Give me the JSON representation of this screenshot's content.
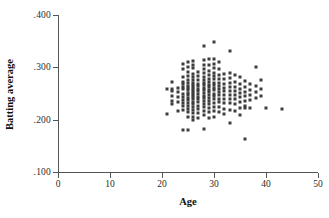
{
  "chart_data": {
    "type": "scatter",
    "title": "",
    "xlabel": "Age",
    "ylabel": "Batting average",
    "xlim": [
      0,
      50
    ],
    "ylim": [
      0.1,
      0.4
    ],
    "xticks": [
      0,
      10,
      20,
      30,
      40,
      50
    ],
    "xtick_labels": [
      "0",
      "10",
      "20",
      "30",
      "40",
      "50"
    ],
    "yticks": [
      0.1,
      0.2,
      0.3,
      0.4
    ],
    "ytick_labels": [
      ".100",
      ".200",
      ".300",
      ".400"
    ],
    "grid": false,
    "legend": null,
    "marker": "square",
    "marker_color": "#3d3d3d",
    "n_points": 206,
    "points": [
      [
        21,
        0.259
      ],
      [
        21,
        0.21
      ],
      [
        22,
        0.272
      ],
      [
        22,
        0.259
      ],
      [
        22,
        0.254
      ],
      [
        22,
        0.246
      ],
      [
        22,
        0.236
      ],
      [
        22,
        0.229
      ],
      [
        23,
        0.261
      ],
      [
        23,
        0.253
      ],
      [
        23,
        0.244
      ],
      [
        23,
        0.234
      ],
      [
        23,
        0.216
      ],
      [
        24,
        0.306
      ],
      [
        24,
        0.296
      ],
      [
        24,
        0.281
      ],
      [
        24,
        0.272
      ],
      [
        24,
        0.268
      ],
      [
        24,
        0.263
      ],
      [
        24,
        0.258
      ],
      [
        24,
        0.25
      ],
      [
        24,
        0.243
      ],
      [
        24,
        0.238
      ],
      [
        24,
        0.232
      ],
      [
        24,
        0.226
      ],
      [
        24,
        0.219
      ],
      [
        24,
        0.18
      ],
      [
        25,
        0.311
      ],
      [
        25,
        0.3
      ],
      [
        25,
        0.291
      ],
      [
        25,
        0.284
      ],
      [
        25,
        0.276
      ],
      [
        25,
        0.27
      ],
      [
        25,
        0.265
      ],
      [
        25,
        0.26
      ],
      [
        25,
        0.256
      ],
      [
        25,
        0.251
      ],
      [
        25,
        0.247
      ],
      [
        25,
        0.242
      ],
      [
        25,
        0.237
      ],
      [
        25,
        0.231
      ],
      [
        25,
        0.226
      ],
      [
        25,
        0.221
      ],
      [
        25,
        0.214
      ],
      [
        25,
        0.205
      ],
      [
        25,
        0.18
      ],
      [
        26,
        0.312
      ],
      [
        26,
        0.305
      ],
      [
        26,
        0.298
      ],
      [
        26,
        0.288
      ],
      [
        26,
        0.281
      ],
      [
        26,
        0.275
      ],
      [
        26,
        0.271
      ],
      [
        26,
        0.267
      ],
      [
        26,
        0.263
      ],
      [
        26,
        0.259
      ],
      [
        26,
        0.255
      ],
      [
        26,
        0.251
      ],
      [
        26,
        0.247
      ],
      [
        26,
        0.243
      ],
      [
        26,
        0.239
      ],
      [
        26,
        0.234
      ],
      [
        26,
        0.229
      ],
      [
        26,
        0.224
      ],
      [
        26,
        0.218
      ],
      [
        26,
        0.212
      ],
      [
        26,
        0.206
      ],
      [
        26,
        0.199
      ],
      [
        27,
        0.291
      ],
      [
        27,
        0.283
      ],
      [
        27,
        0.276
      ],
      [
        27,
        0.269
      ],
      [
        27,
        0.264
      ],
      [
        27,
        0.259
      ],
      [
        27,
        0.254
      ],
      [
        27,
        0.249
      ],
      [
        27,
        0.244
      ],
      [
        27,
        0.239
      ],
      [
        27,
        0.233
      ],
      [
        27,
        0.227
      ],
      [
        27,
        0.221
      ],
      [
        27,
        0.213
      ],
      [
        27,
        0.204
      ],
      [
        28,
        0.34
      ],
      [
        28,
        0.314
      ],
      [
        28,
        0.305
      ],
      [
        28,
        0.297
      ],
      [
        28,
        0.289
      ],
      [
        28,
        0.282
      ],
      [
        28,
        0.276
      ],
      [
        28,
        0.271
      ],
      [
        28,
        0.266
      ],
      [
        28,
        0.261
      ],
      [
        28,
        0.256
      ],
      [
        28,
        0.251
      ],
      [
        28,
        0.246
      ],
      [
        28,
        0.241
      ],
      [
        28,
        0.236
      ],
      [
        28,
        0.23
      ],
      [
        28,
        0.224
      ],
      [
        28,
        0.217
      ],
      [
        28,
        0.208
      ],
      [
        28,
        0.182
      ],
      [
        29,
        0.316
      ],
      [
        29,
        0.304
      ],
      [
        29,
        0.293
      ],
      [
        29,
        0.285
      ],
      [
        29,
        0.278
      ],
      [
        29,
        0.272
      ],
      [
        29,
        0.267
      ],
      [
        29,
        0.262
      ],
      [
        29,
        0.257
      ],
      [
        29,
        0.252
      ],
      [
        29,
        0.247
      ],
      [
        29,
        0.242
      ],
      [
        29,
        0.236
      ],
      [
        29,
        0.229
      ],
      [
        29,
        0.222
      ],
      [
        29,
        0.214
      ],
      [
        29,
        0.203
      ],
      [
        30,
        0.348
      ],
      [
        30,
        0.315
      ],
      [
        30,
        0.306
      ],
      [
        30,
        0.298
      ],
      [
        30,
        0.29
      ],
      [
        30,
        0.283
      ],
      [
        30,
        0.277
      ],
      [
        30,
        0.271
      ],
      [
        30,
        0.266
      ],
      [
        30,
        0.261
      ],
      [
        30,
        0.256
      ],
      [
        30,
        0.25
      ],
      [
        30,
        0.245
      ],
      [
        30,
        0.239
      ],
      [
        30,
        0.232
      ],
      [
        30,
        0.225
      ],
      [
        30,
        0.216
      ],
      [
        30,
        0.206
      ],
      [
        31,
        0.31
      ],
      [
        31,
        0.296
      ],
      [
        31,
        0.286
      ],
      [
        31,
        0.278
      ],
      [
        31,
        0.271
      ],
      [
        31,
        0.265
      ],
      [
        31,
        0.259
      ],
      [
        31,
        0.253
      ],
      [
        31,
        0.247
      ],
      [
        31,
        0.24
      ],
      [
        31,
        0.233
      ],
      [
        31,
        0.224
      ],
      [
        31,
        0.214
      ],
      [
        32,
        0.288
      ],
      [
        32,
        0.277
      ],
      [
        32,
        0.268
      ],
      [
        32,
        0.261
      ],
      [
        32,
        0.254
      ],
      [
        32,
        0.247
      ],
      [
        32,
        0.24
      ],
      [
        32,
        0.231
      ],
      [
        32,
        0.221
      ],
      [
        32,
        0.211
      ],
      [
        33,
        0.331
      ],
      [
        33,
        0.29
      ],
      [
        33,
        0.279
      ],
      [
        33,
        0.27
      ],
      [
        33,
        0.262
      ],
      [
        33,
        0.255
      ],
      [
        33,
        0.248
      ],
      [
        33,
        0.24
      ],
      [
        33,
        0.231
      ],
      [
        33,
        0.219
      ],
      [
        33,
        0.193
      ],
      [
        34,
        0.286
      ],
      [
        34,
        0.272
      ],
      [
        34,
        0.263
      ],
      [
        34,
        0.255
      ],
      [
        34,
        0.247
      ],
      [
        34,
        0.239
      ],
      [
        34,
        0.229
      ],
      [
        34,
        0.217
      ],
      [
        35,
        0.281
      ],
      [
        35,
        0.268
      ],
      [
        35,
        0.259
      ],
      [
        35,
        0.251
      ],
      [
        35,
        0.243
      ],
      [
        35,
        0.234
      ],
      [
        35,
        0.223
      ],
      [
        35,
        0.209
      ],
      [
        36,
        0.273
      ],
      [
        36,
        0.262
      ],
      [
        36,
        0.253
      ],
      [
        36,
        0.245
      ],
      [
        36,
        0.236
      ],
      [
        36,
        0.226
      ],
      [
        36,
        0.222
      ],
      [
        36,
        0.163
      ],
      [
        37,
        0.269
      ],
      [
        37,
        0.257
      ],
      [
        37,
        0.248
      ],
      [
        37,
        0.238
      ],
      [
        37,
        0.223
      ],
      [
        38,
        0.301
      ],
      [
        38,
        0.265
      ],
      [
        38,
        0.252
      ],
      [
        38,
        0.241
      ],
      [
        39,
        0.276
      ],
      [
        39,
        0.259
      ],
      [
        39,
        0.245
      ],
      [
        40,
        0.223
      ],
      [
        43,
        0.22
      ]
    ]
  },
  "axes": {
    "x_title": "Age",
    "y_title": "Batting average"
  }
}
